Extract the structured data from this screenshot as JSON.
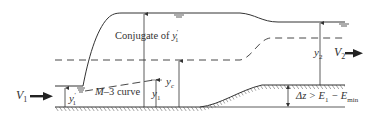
{
  "diagram": {
    "title": "",
    "labels": {
      "v1": "V",
      "v1_sub": "1",
      "v2": "V",
      "v2_sub": "2",
      "y1_prime": "y",
      "y1_prime_sub": "1",
      "y1_prime_mark": "'",
      "y1": "y",
      "y1_sub": "1",
      "yc": "y",
      "yc_sub": "c",
      "y2": "y",
      "y2_sub": "2",
      "conjugate": "Conjugate of ",
      "conjugate_var": "y",
      "conjugate_sub": "1",
      "conjugate_mark": "'",
      "m3_curve_italic": "M",
      "m3_curve_rest": "–3 curve",
      "delta_z_prefix": "Δz > E",
      "delta_z_sub1": "1",
      "delta_z_mid": " − E",
      "delta_z_sub2": "min"
    },
    "colors": {
      "line": "#333333",
      "background": "#ffffff"
    }
  }
}
